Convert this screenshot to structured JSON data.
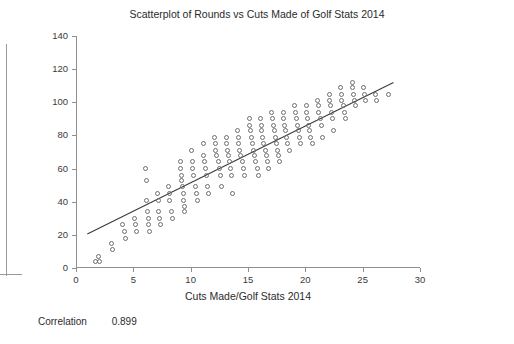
{
  "chart_data": {
    "type": "scatter",
    "title": "Scatterplot of Rounds vs Cuts Made of Golf Stats 2014",
    "xlabel": "Cuts Made/Golf Stats 2014",
    "ylabel": "Rounds/Golf Stats 2014",
    "xlim": [
      0,
      30
    ],
    "ylim": [
      0,
      140
    ],
    "xticks": [
      0,
      5,
      10,
      15,
      20,
      25,
      30
    ],
    "yticks": [
      0,
      20,
      40,
      60,
      80,
      100,
      120,
      140
    ],
    "grid": false,
    "legend": "none",
    "marker": "open-circle",
    "point_color": "#6e6e6e",
    "trendline": {
      "show": true,
      "color": "#3a3a3a",
      "x_start": 0.9,
      "y_start": 20.5,
      "x_end": 27.6,
      "y_end": 112.0
    },
    "points": [
      [
        1.6,
        4
      ],
      [
        1.9,
        7
      ],
      [
        2.0,
        4
      ],
      [
        3.0,
        15
      ],
      [
        3.1,
        11
      ],
      [
        4.0,
        26
      ],
      [
        4.1,
        22
      ],
      [
        4.2,
        18
      ],
      [
        5.0,
        30
      ],
      [
        5.1,
        26
      ],
      [
        5.2,
        22
      ],
      [
        6.0,
        60
      ],
      [
        6.05,
        53
      ],
      [
        6.1,
        41
      ],
      [
        6.15,
        34
      ],
      [
        6.2,
        30
      ],
      [
        6.25,
        26
      ],
      [
        6.3,
        22
      ],
      [
        7.0,
        45
      ],
      [
        7.1,
        41
      ],
      [
        7.15,
        34
      ],
      [
        7.2,
        30
      ],
      [
        7.25,
        26
      ],
      [
        8.0,
        49
      ],
      [
        8.05,
        45
      ],
      [
        8.1,
        41
      ],
      [
        8.2,
        34
      ],
      [
        8.3,
        30
      ],
      [
        9.0,
        64
      ],
      [
        9.05,
        60
      ],
      [
        9.1,
        56
      ],
      [
        9.15,
        53
      ],
      [
        9.2,
        49
      ],
      [
        9.25,
        45
      ],
      [
        9.3,
        41
      ],
      [
        9.35,
        37
      ],
      [
        9.4,
        34
      ],
      [
        10.0,
        71
      ],
      [
        10.05,
        64
      ],
      [
        10.1,
        60
      ],
      [
        10.2,
        56
      ],
      [
        10.3,
        49
      ],
      [
        10.4,
        45
      ],
      [
        10.5,
        41
      ],
      [
        11.0,
        75
      ],
      [
        11.05,
        68
      ],
      [
        11.1,
        64
      ],
      [
        11.2,
        60
      ],
      [
        11.3,
        56
      ],
      [
        11.4,
        49
      ],
      [
        11.5,
        45
      ],
      [
        12.0,
        79
      ],
      [
        12.05,
        75
      ],
      [
        12.1,
        71
      ],
      [
        12.2,
        68
      ],
      [
        12.3,
        64
      ],
      [
        12.4,
        60
      ],
      [
        12.5,
        56
      ],
      [
        12.6,
        49
      ],
      [
        13.0,
        79
      ],
      [
        13.05,
        75
      ],
      [
        13.1,
        71
      ],
      [
        13.2,
        68
      ],
      [
        13.3,
        64
      ],
      [
        13.4,
        60
      ],
      [
        13.5,
        56
      ],
      [
        13.6,
        45
      ],
      [
        14.0,
        83
      ],
      [
        14.05,
        79
      ],
      [
        14.1,
        75
      ],
      [
        14.2,
        71
      ],
      [
        14.3,
        68
      ],
      [
        14.4,
        64
      ],
      [
        14.5,
        60
      ],
      [
        14.6,
        56
      ],
      [
        15.0,
        90
      ],
      [
        15.05,
        86
      ],
      [
        15.1,
        83
      ],
      [
        15.2,
        79
      ],
      [
        15.3,
        75
      ],
      [
        15.4,
        71
      ],
      [
        15.5,
        68
      ],
      [
        15.6,
        64
      ],
      [
        15.7,
        60
      ],
      [
        15.8,
        56
      ],
      [
        16.0,
        90
      ],
      [
        16.05,
        86
      ],
      [
        16.1,
        83
      ],
      [
        16.2,
        79
      ],
      [
        16.3,
        75
      ],
      [
        16.4,
        71
      ],
      [
        16.5,
        68
      ],
      [
        16.6,
        64
      ],
      [
        16.7,
        60
      ],
      [
        17.0,
        94
      ],
      [
        17.05,
        90
      ],
      [
        17.1,
        86
      ],
      [
        17.2,
        83
      ],
      [
        17.3,
        79
      ],
      [
        17.4,
        75
      ],
      [
        17.5,
        71
      ],
      [
        17.6,
        68
      ],
      [
        17.7,
        64
      ],
      [
        18.0,
        94
      ],
      [
        18.05,
        90
      ],
      [
        18.1,
        86
      ],
      [
        18.2,
        83
      ],
      [
        18.3,
        79
      ],
      [
        18.4,
        75
      ],
      [
        18.5,
        71
      ],
      [
        19.0,
        98
      ],
      [
        19.05,
        94
      ],
      [
        19.1,
        90
      ],
      [
        19.2,
        86
      ],
      [
        19.3,
        83
      ],
      [
        19.4,
        79
      ],
      [
        19.5,
        75
      ],
      [
        20.0,
        98
      ],
      [
        20.05,
        94
      ],
      [
        20.1,
        90
      ],
      [
        20.2,
        86
      ],
      [
        20.3,
        83
      ],
      [
        20.4,
        79
      ],
      [
        20.5,
        75
      ],
      [
        21.0,
        101
      ],
      [
        21.05,
        98
      ],
      [
        21.1,
        94
      ],
      [
        21.2,
        90
      ],
      [
        21.3,
        86
      ],
      [
        21.4,
        79
      ],
      [
        22.0,
        105
      ],
      [
        22.05,
        101
      ],
      [
        22.1,
        98
      ],
      [
        22.2,
        94
      ],
      [
        22.3,
        90
      ],
      [
        22.4,
        83
      ],
      [
        23.0,
        109
      ],
      [
        23.05,
        105
      ],
      [
        23.1,
        101
      ],
      [
        23.2,
        98
      ],
      [
        23.3,
        94
      ],
      [
        23.4,
        90
      ],
      [
        24.0,
        112
      ],
      [
        24.05,
        109
      ],
      [
        24.1,
        105
      ],
      [
        24.2,
        101
      ],
      [
        24.3,
        98
      ],
      [
        25.0,
        109
      ],
      [
        25.1,
        105
      ],
      [
        25.2,
        101
      ],
      [
        26.0,
        105
      ],
      [
        26.1,
        101
      ],
      [
        27.2,
        105
      ]
    ]
  },
  "footer": {
    "correlation_label": "Correlation",
    "correlation_value": "0.899"
  }
}
